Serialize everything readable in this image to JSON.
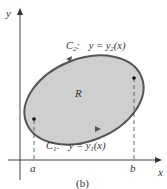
{
  "diagram": {
    "caption": "(b)",
    "region_label": "R",
    "axes": {
      "x_label": "x",
      "y_label": "y"
    },
    "ticks": {
      "a": "a",
      "b": "b"
    },
    "curves": {
      "upper": {
        "name": "C",
        "sub": "2",
        "eq_prefix": "y = y",
        "eq_sub": "2",
        "eq_suffix": "(x)",
        "colon": ":"
      },
      "lower": {
        "name": "C",
        "sub": "1",
        "eq_prefix": "y = y",
        "eq_sub": "1",
        "eq_suffix": "(x)",
        "colon": ":"
      }
    },
    "colors": {
      "fill": "#cfcfcf",
      "stroke": "#555555",
      "axis": "#444444",
      "text": "#333333"
    }
  }
}
